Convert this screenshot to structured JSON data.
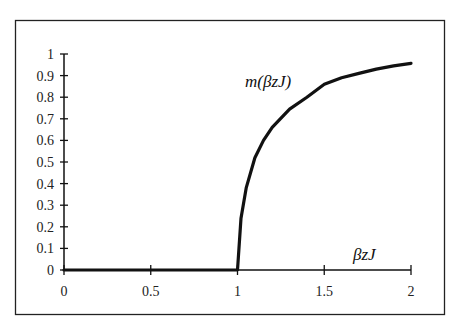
{
  "chart_data": {
    "type": "line",
    "title": "",
    "xlabel": "βzJ",
    "ylabel": "",
    "curve_label": "m(βzJ)",
    "xlim": [
      0,
      2
    ],
    "ylim": [
      0,
      1
    ],
    "grid": false,
    "legend": "none",
    "x_ticks": [
      "0",
      "0.5",
      "1",
      "1.5",
      "2"
    ],
    "y_ticks": [
      "0",
      "0.1",
      "0.2",
      "0.3",
      "0.4",
      "0.5",
      "0.6",
      "0.7",
      "0.8",
      "0.9",
      "1"
    ],
    "series": [
      {
        "name": "m(βzJ)",
        "x": [
          0,
          0.5,
          1.0,
          1.0,
          1.02,
          1.05,
          1.1,
          1.15,
          1.2,
          1.3,
          1.4,
          1.5,
          1.6,
          1.7,
          1.8,
          1.9,
          2.0
        ],
        "y": [
          0,
          0,
          0,
          0.0,
          0.24,
          0.38,
          0.52,
          0.6,
          0.66,
          0.745,
          0.8,
          0.86,
          0.89,
          0.91,
          0.93,
          0.945,
          0.957
        ]
      }
    ]
  }
}
